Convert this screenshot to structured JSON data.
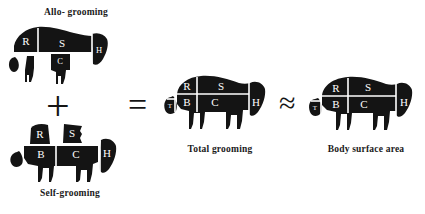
{
  "figure": {
    "background_color": "#ffffff",
    "ink_color": "#141414",
    "label_color": "#ffffff",
    "width": 425,
    "height": 214
  },
  "panels": {
    "allo_grooming": {
      "caption": "Allo- grooming",
      "body_region_labels": [
        "R",
        "S",
        "C",
        "H"
      ],
      "description": "fragmented animal silhouette: rump and side upper band with head, plus detached tail, leg and chest pieces"
    },
    "self_grooming": {
      "caption": "Self-grooming",
      "body_region_labels": [
        "R",
        "S",
        "B",
        "C",
        "H",
        "T"
      ],
      "description": "animal silhouette with detached rump and side patches above belly and chest band"
    },
    "total_grooming": {
      "caption": "Total grooming",
      "body_region_labels": [
        "R",
        "S",
        "B",
        "C",
        "H",
        "T"
      ],
      "description": "complete animal silhouette partitioned into grooming regions"
    },
    "body_surface_area": {
      "caption": "Body surface area",
      "body_region_labels": [
        "R",
        "S",
        "B",
        "C",
        "H",
        "T"
      ],
      "description": "reference animal silhouette partitioned into body surface regions"
    }
  },
  "operators": {
    "plus": "+",
    "equals": "=",
    "approx": "≈"
  },
  "region_key": {
    "R": "rump",
    "S": "side",
    "B": "belly",
    "C": "chest",
    "H": "head",
    "T": "tail"
  }
}
